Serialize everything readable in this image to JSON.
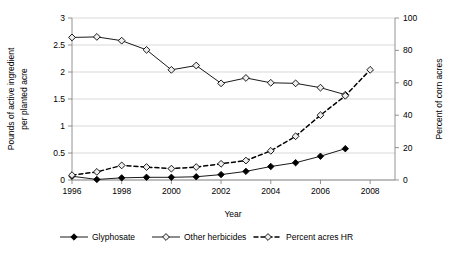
{
  "chart_data": {
    "type": "line",
    "title": "",
    "xlabel": "Year",
    "ylabel": "Pounds of active ingredient per planted acre",
    "ylabel_right": "Percent of corn acres",
    "x": [
      1996,
      1997,
      1998,
      1999,
      2000,
      2001,
      2002,
      2003,
      2004,
      2005,
      2006,
      2007
    ],
    "xlim": [
      1996,
      2009
    ],
    "ylim": [
      0,
      3
    ],
    "ylim_right": [
      0,
      100
    ],
    "grid": true,
    "legend_position": "bottom",
    "xticks": [
      "1996",
      "1998",
      "2000",
      "2002",
      "2004",
      "2006",
      "2008"
    ],
    "xtick_values": [
      1996,
      1998,
      2000,
      2002,
      2004,
      2006,
      2008
    ],
    "yticks": [
      "0",
      "0.5",
      "1",
      "1.5",
      "2",
      "2.5",
      "3"
    ],
    "ytick_values": [
      0,
      0.5,
      1,
      1.5,
      2,
      2.5,
      3
    ],
    "yticks_right": [
      "0",
      "20",
      "40",
      "60",
      "80",
      "100"
    ],
    "ytick_values_right": [
      0,
      20,
      40,
      60,
      80,
      100
    ],
    "series": [
      {
        "name": "Glyphosate",
        "axis": "left",
        "marker": "filled-diamond",
        "linestyle": "solid",
        "color": "#000000",
        "x": [
          1996,
          1997,
          1998,
          1999,
          2000,
          2001,
          2002,
          2003,
          2004,
          2005,
          2006,
          2007
        ],
        "values": [
          0.07,
          0.01,
          0.04,
          0.05,
          0.05,
          0.06,
          0.1,
          0.16,
          0.25,
          0.32,
          0.44,
          0.58
        ]
      },
      {
        "name": "Other herbicides",
        "axis": "left",
        "marker": "open-diamond",
        "linestyle": "solid",
        "color": "#000000",
        "x": [
          1996,
          1997,
          1998,
          1999,
          2000,
          2001,
          2002,
          2003,
          2004,
          2005,
          2006,
          2007
        ],
        "values": [
          2.64,
          2.65,
          2.58,
          2.41,
          2.04,
          2.12,
          1.79,
          1.89,
          1.8,
          1.79,
          1.71,
          1.58
        ]
      },
      {
        "name": "Percent acres HR",
        "axis": "right",
        "marker": "open-diamond",
        "linestyle": "dashed",
        "color": "#000000",
        "x": [
          1996,
          1997,
          1998,
          1999,
          2000,
          2001,
          2002,
          2003,
          2004,
          2005,
          2006,
          2007,
          2008
        ],
        "values": [
          3,
          5,
          9,
          8,
          7,
          8,
          10,
          12,
          18,
          27,
          40,
          52,
          68
        ]
      }
    ]
  },
  "legend": {
    "items": [
      {
        "label": "Glyphosate"
      },
      {
        "label": "Other herbicides"
      },
      {
        "label": "Percent acres HR"
      }
    ]
  }
}
